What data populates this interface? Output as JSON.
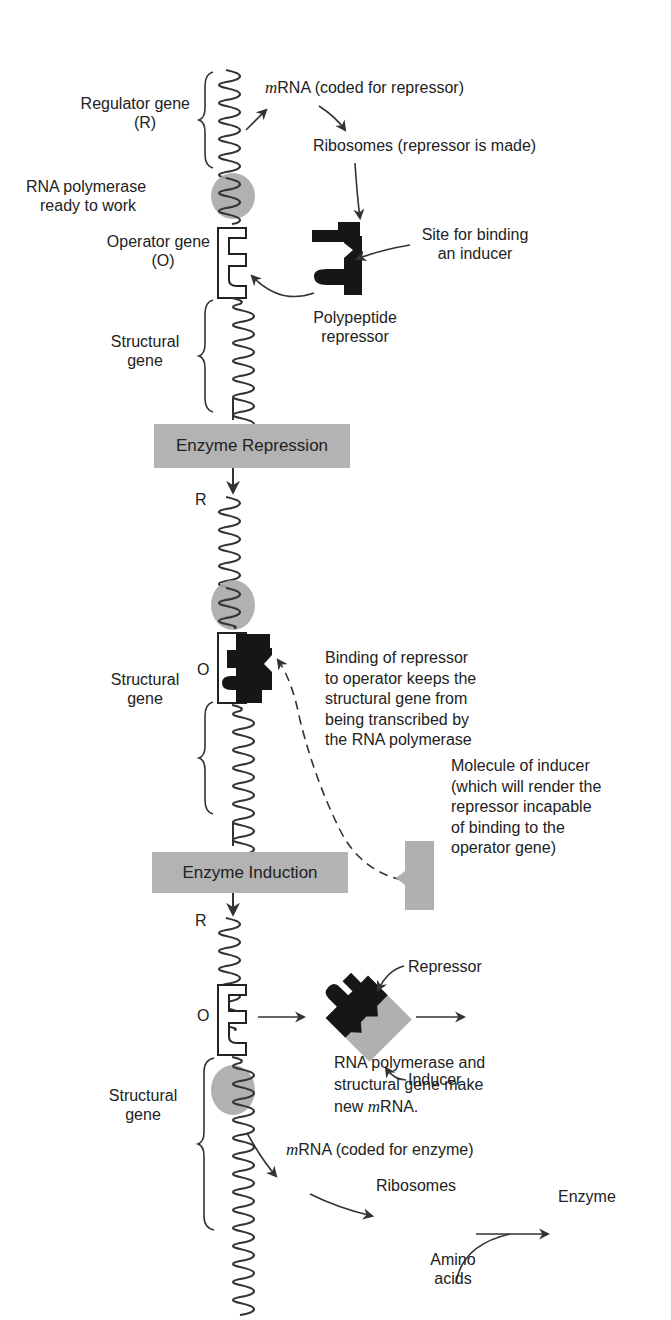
{
  "figure": {
    "colors": {
      "ink": "#222222",
      "gray_fill": "#b0b0b0",
      "polymerase": "#a9a9a9",
      "background": "#ffffff"
    }
  },
  "panel_top": {
    "regulator_gene": [
      "Regulator gene",
      "(R)"
    ],
    "mrna_label_italic": "m",
    "mrna_label_rest": "RNA (coded for repressor)",
    "ribosomes_label": "Ribosomes (repressor is made)",
    "rna_polymerase": [
      "RNA polymerase",
      "ready to work"
    ],
    "operator_gene": [
      "Operator gene",
      "(O)"
    ],
    "site_binding": [
      "Site for binding",
      "an inducer"
    ],
    "polypeptide_repressor": [
      "Polypeptide",
      "repressor"
    ],
    "structural_gene": [
      "Structural",
      "gene"
    ]
  },
  "stage_repression": {
    "label": "Enzyme Repression"
  },
  "panel_middle": {
    "r_label": "R",
    "o_label": "O",
    "binding_note": [
      "Binding of repressor",
      "to operator keeps the",
      "structural gene from",
      "being transcribed by",
      "the RNA polymerase"
    ],
    "structural_gene": [
      "Structural",
      "gene"
    ],
    "inducer_molecule_note": [
      "Molecule of inducer",
      "(which will render the",
      "repressor incapable",
      "of binding to the",
      "operator gene)"
    ]
  },
  "stage_induction": {
    "label": "Enzyme Induction"
  },
  "panel_bottom": {
    "r_label": "R",
    "o_label": "O",
    "repressor_label": "Repressor",
    "inducer_label": "Inducer",
    "polymerase_note_line1": "RNA polymerase and",
    "polymerase_note_line2": "structural gene make",
    "polymerase_note_line3_pre": "new ",
    "polymerase_note_line3_italic": "m",
    "polymerase_note_line3_post": "RNA.",
    "structural_gene": [
      "Structural",
      "gene"
    ],
    "mrna_italic": "m",
    "mrna_rest": "RNA (coded for enzyme)",
    "ribosomes": "Ribosomes",
    "enzyme": "Enzyme",
    "amino_acids": [
      "Amino",
      "acids"
    ]
  }
}
